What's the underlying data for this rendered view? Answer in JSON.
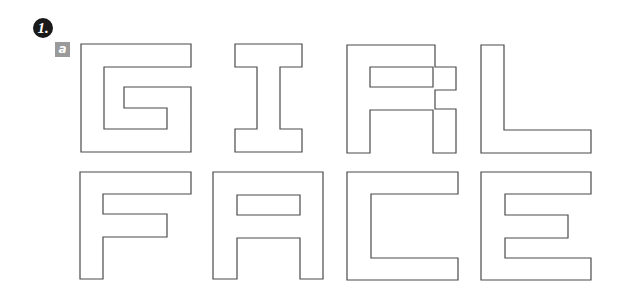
{
  "header": {
    "step_label": "1.",
    "sub_label": "a"
  },
  "words": [
    {
      "text": "GIRL",
      "letters": [
        "G",
        "I",
        "R",
        "L"
      ]
    },
    {
      "text": "FACE",
      "letters": [
        "F",
        "A",
        "C",
        "E"
      ]
    }
  ],
  "colors": {
    "step_badge_bg": "#1a1a1a",
    "sub_badge_bg": "#9a9a9a",
    "outline": "#4a4a4a",
    "background": "#ffffff"
  }
}
